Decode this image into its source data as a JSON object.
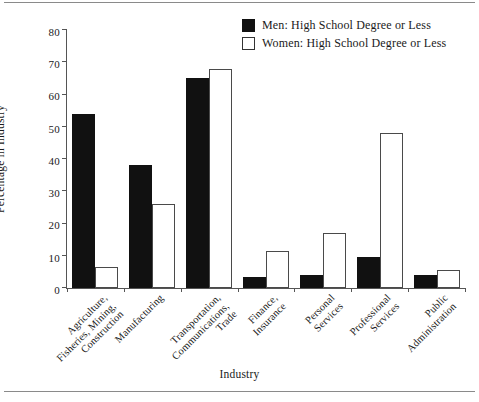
{
  "chart_data": {
    "type": "bar",
    "title": "",
    "xlabel": "Industry",
    "ylabel": "Percentage in Industry",
    "ylim": [
      0,
      80
    ],
    "yticks": [
      0,
      10,
      20,
      30,
      40,
      50,
      60,
      70,
      80
    ],
    "grid": false,
    "legend_position": "top-right",
    "categories": [
      "Agriculture, Fisheries, Mining, Construction",
      "Manufacturing",
      "Transportation, Communications, Trade",
      "Finance, Insurance",
      "Personal Services",
      "Professional Services",
      "Public Administration"
    ],
    "category_lines": [
      [
        "Agriculture,",
        "Fisheries, Mining,",
        "Construction"
      ],
      [
        "Manufacturing"
      ],
      [
        "Transportation,",
        "Communications,",
        "Trade"
      ],
      [
        "Finance,",
        "Insurance"
      ],
      [
        "Personal",
        "Services"
      ],
      [
        "Professional",
        "Services"
      ],
      [
        "Public",
        "Administration"
      ]
    ],
    "series": [
      {
        "name": "Men: High School Degree or Less",
        "color": "#111111",
        "values": [
          54,
          38,
          65,
          3.5,
          4,
          9.5,
          4
        ]
      },
      {
        "name": "Women: High School Degree or Less",
        "color": "#ffffff",
        "values": [
          6.5,
          26,
          68,
          11.5,
          17,
          48,
          5.5
        ]
      }
    ]
  },
  "legend": {
    "items": [
      {
        "label": "Men: High School Degree or Less",
        "swatch": "filled-black-square"
      },
      {
        "label": "Women: High School Degree or Less",
        "swatch": "open-white-square"
      }
    ]
  },
  "axes": {
    "y_title": "Percentage in Industry",
    "x_title": "Industry",
    "y_tick_labels": [
      "80",
      "70",
      "60",
      "50",
      "40",
      "30",
      "20",
      "10",
      "0"
    ]
  }
}
